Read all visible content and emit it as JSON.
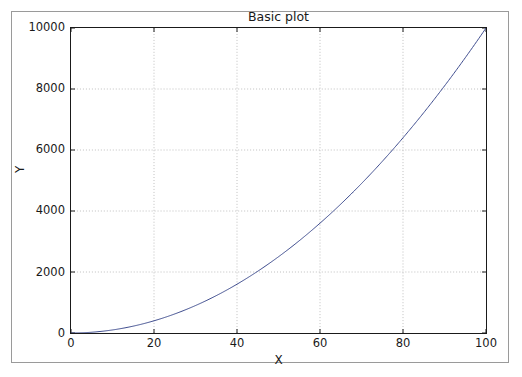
{
  "figure": {
    "title": "Basic plot",
    "caption": "",
    "background_color": "#ffffff",
    "frame_color": "#9a9a9a"
  },
  "axis": {
    "xlabel": "X",
    "ylabel": "Y",
    "xticks": [
      "0",
      "20",
      "40",
      "60",
      "80",
      "100"
    ],
    "yticks": [
      "0",
      "2000",
      "4000",
      "6000",
      "8000",
      "10000"
    ],
    "axis_color": "#1a1a1a",
    "grid_color": "#b0b0b0"
  },
  "chart_data": {
    "type": "line",
    "title": "Basic plot",
    "xlabel": "X",
    "ylabel": "Y",
    "xlim": [
      0,
      100
    ],
    "ylim": [
      0,
      10000
    ],
    "xticks": [
      0,
      20,
      40,
      60,
      80,
      100
    ],
    "yticks": [
      0,
      2000,
      4000,
      6000,
      8000,
      10000
    ],
    "grid": true,
    "grid_style": "dotted",
    "legend": null,
    "series": [
      {
        "name": "y = x^2",
        "color": "#3b4a8c",
        "linewidth": 1,
        "x": [
          0,
          5,
          10,
          15,
          20,
          25,
          30,
          35,
          40,
          45,
          50,
          55,
          60,
          65,
          70,
          75,
          80,
          85,
          90,
          95,
          100
        ],
        "values": [
          0,
          25,
          100,
          225,
          400,
          625,
          900,
          1225,
          1600,
          2025,
          2500,
          3025,
          3600,
          4225,
          4900,
          5625,
          6400,
          7225,
          8100,
          9025,
          10000
        ]
      }
    ]
  }
}
